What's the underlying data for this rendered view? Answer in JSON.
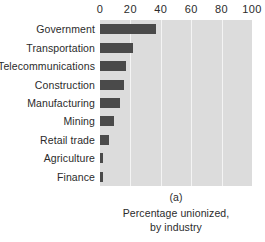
{
  "chart_data": {
    "type": "bar",
    "orientation": "horizontal",
    "title": "",
    "xlabel": "",
    "ylabel": "",
    "xlim": [
      0,
      100
    ],
    "xticks": [
      0,
      20,
      40,
      60,
      80,
      100
    ],
    "grid": true,
    "legend": false,
    "categories": [
      "Government",
      "Transportation",
      "Telecommunications",
      "Construction",
      "Manufacturing",
      "Mining",
      "Retail trade",
      "Agriculture",
      "Finance"
    ],
    "values": [
      37,
      22,
      17,
      16,
      13,
      9,
      6,
      2,
      2
    ],
    "caption_index": "(a)",
    "caption_line1": "Percentage unionized,",
    "caption_line2": "by industry",
    "colors": {
      "bar": "#4a4a4a",
      "plot_background": "#dcdcdc",
      "gridline": "#f4f4f4",
      "text": "#2b2b2b",
      "page_background": "#ffffff"
    }
  }
}
